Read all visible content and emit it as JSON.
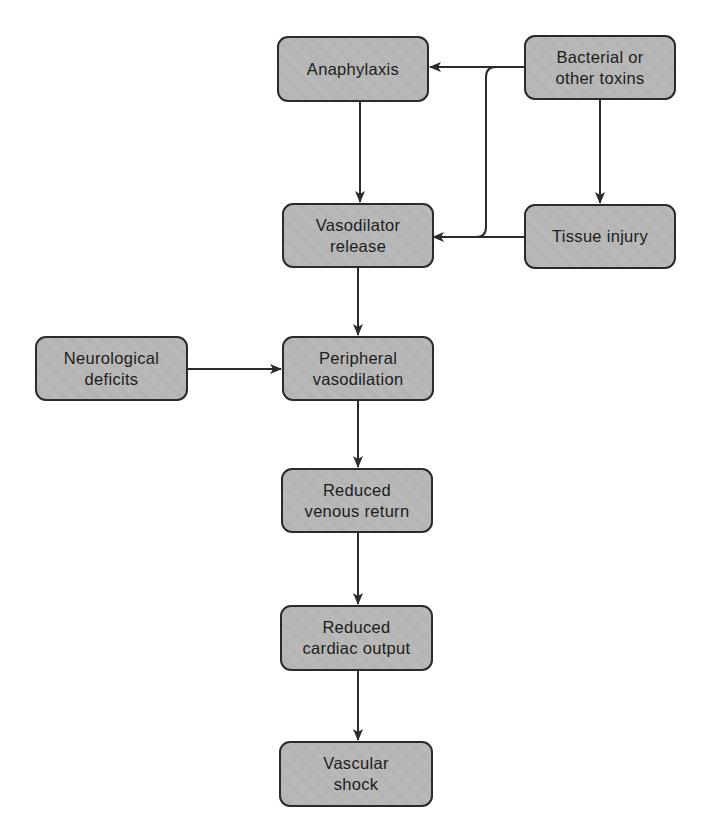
{
  "diagram": {
    "type": "flowchart",
    "colors": {
      "node_fill": "#b8b8b8",
      "node_border": "#2b2b2b",
      "text": "#1c1c1c",
      "edge": "#2b2b2b",
      "background": "#ffffff"
    },
    "nodes": {
      "anaphylaxis": {
        "label": "Anaphylaxis"
      },
      "bacterial_toxins": {
        "label": "Bacterial or\nother toxins"
      },
      "vasodilator_release": {
        "label": "Vasodilator\nrelease"
      },
      "tissue_injury": {
        "label": "Tissue injury"
      },
      "neurological_deficits": {
        "label": "Neurological\ndeficits"
      },
      "peripheral_vasodilation": {
        "label": "Peripheral\nvasodilation"
      },
      "reduced_venous_return": {
        "label": "Reduced\nvenous return"
      },
      "reduced_cardiac_output": {
        "label": "Reduced\ncardiac output"
      },
      "vascular_shock": {
        "label": "Vascular\nshock"
      }
    },
    "edges": [
      {
        "from": "bacterial_toxins",
        "to": "anaphylaxis"
      },
      {
        "from": "bacterial_toxins",
        "to": "vasodilator_release"
      },
      {
        "from": "bacterial_toxins",
        "to": "tissue_injury"
      },
      {
        "from": "anaphylaxis",
        "to": "vasodilator_release"
      },
      {
        "from": "tissue_injury",
        "to": "vasodilator_release"
      },
      {
        "from": "vasodilator_release",
        "to": "peripheral_vasodilation"
      },
      {
        "from": "neurological_deficits",
        "to": "peripheral_vasodilation"
      },
      {
        "from": "peripheral_vasodilation",
        "to": "reduced_venous_return"
      },
      {
        "from": "reduced_venous_return",
        "to": "reduced_cardiac_output"
      },
      {
        "from": "reduced_cardiac_output",
        "to": "vascular_shock"
      }
    ]
  }
}
